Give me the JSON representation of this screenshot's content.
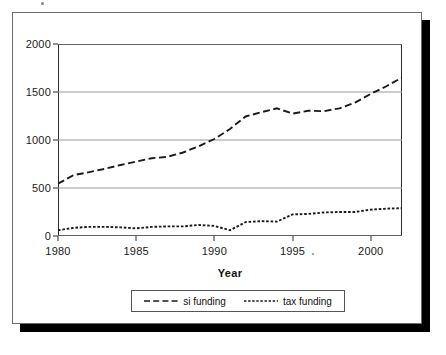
{
  "chart_data": {
    "type": "line",
    "title": "",
    "xlabel": "Year",
    "ylabel": "",
    "xlim": [
      1980,
      2002
    ],
    "ylim": [
      0,
      2000
    ],
    "grid": true,
    "legend_position": "bottom",
    "xticks": [
      1980,
      1985,
      1990,
      1995,
      2000
    ],
    "xtick_labels": [
      "1980",
      "1985",
      "1990",
      "1995",
      "2000"
    ],
    "yticks": [
      0,
      500,
      1000,
      1500,
      2000
    ],
    "ytick_labels": [
      "0",
      "500",
      "1000",
      "1500",
      "2000"
    ],
    "x": [
      1980,
      1981,
      1982,
      1983,
      1984,
      1985,
      1986,
      1987,
      1988,
      1989,
      1990,
      1991,
      1992,
      1993,
      1994,
      1995,
      1996,
      1997,
      1998,
      1999,
      2000,
      2001,
      2002
    ],
    "series": [
      {
        "name": "si funding",
        "dash": "long-dash",
        "color": "#1a1a1a",
        "values": [
          545,
          635,
          665,
          700,
          740,
          775,
          810,
          825,
          870,
          935,
          1010,
          1115,
          1245,
          1290,
          1330,
          1275,
          1305,
          1300,
          1330,
          1390,
          1480,
          1560,
          1650
        ]
      },
      {
        "name": "tax funding",
        "dash": "short-dash",
        "color": "#1a1a1a",
        "values": [
          60,
          85,
          95,
          95,
          90,
          80,
          95,
          100,
          100,
          115,
          105,
          60,
          145,
          155,
          150,
          225,
          230,
          245,
          250,
          250,
          275,
          285,
          290
        ]
      }
    ]
  },
  "axis": {
    "x_title": "Year"
  },
  "legend": {
    "entries": [
      {
        "label": "si funding",
        "swatch": "long-dash-line-icon"
      },
      {
        "label": "tax funding",
        "swatch": "short-dash-line-icon"
      }
    ]
  },
  "colors": {
    "line": "#1a1a1a",
    "grid": "#999999",
    "plot_frame": "#2a2a2a",
    "figure_frame": "#6b6b6b",
    "shadow": "#000000",
    "background": "#ffffff"
  }
}
